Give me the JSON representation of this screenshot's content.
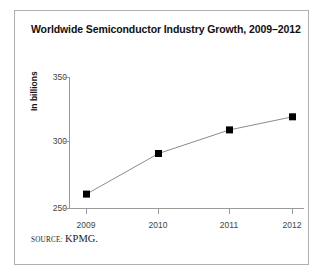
{
  "figure": {
    "title": "Worldwide Semiconductor Industry Growth, 2009–2012",
    "source_word": "SOURCE:",
    "source_value": "KPMG.",
    "border_color": "#b0b0b0",
    "background": "#ffffff"
  },
  "chart_data": {
    "type": "line",
    "title": "Worldwide Semiconductor Industry Growth, 2009–2012",
    "xlabel": "",
    "ylabel": "In billions",
    "categories": [
      "2009",
      "2010",
      "2011",
      "2012"
    ],
    "values": [
      261,
      292,
      310,
      320
    ],
    "series": [
      {
        "name": "Worldwide semiconductor industry revenue",
        "values": [
          261,
          292,
          310,
          320
        ]
      }
    ],
    "ylim": [
      250,
      350
    ],
    "yticks": [
      250,
      300,
      350
    ],
    "ytick_labels": [
      "250",
      "300",
      "350"
    ],
    "xtick_labels": [
      "2009",
      "2010",
      "2011",
      "2012"
    ],
    "grid": false,
    "legend": false,
    "legend_position": "none",
    "line_color": "#8c8c8c",
    "marker_color": "#000000",
    "marker_shape": "square",
    "axis_color": "#9a9a9a"
  }
}
